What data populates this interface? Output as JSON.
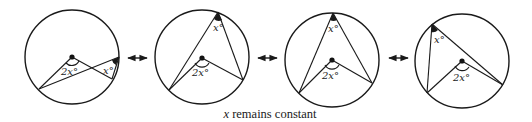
{
  "caption": {
    "variable": "x",
    "text": " remains constant"
  },
  "diagrams": [
    {
      "id": "circle-1",
      "central_angle_label": "2x°",
      "inscribed_angle_label": "x°"
    },
    {
      "id": "circle-2",
      "central_angle_label": "2x°",
      "inscribed_angle_label": "x°"
    },
    {
      "id": "circle-3",
      "central_angle_label": "2x°",
      "inscribed_angle_label": "x°"
    },
    {
      "id": "circle-4",
      "central_angle_label": "2x°",
      "inscribed_angle_label": "x°"
    }
  ],
  "arrows": [
    {
      "id": "arrow-1-2",
      "symbol": "double-headed-arrow"
    },
    {
      "id": "arrow-2-3",
      "symbol": "double-headed-arrow"
    },
    {
      "id": "arrow-3-4",
      "symbol": "double-headed-arrow"
    }
  ]
}
